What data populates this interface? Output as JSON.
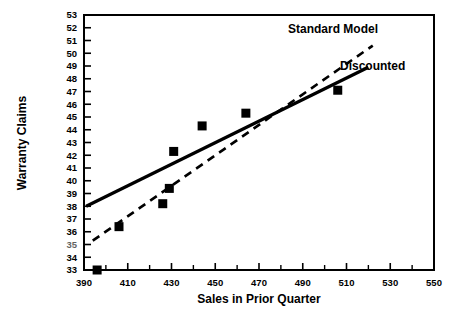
{
  "chart_data": {
    "type": "scatter",
    "title": "",
    "xlabel": "Sales in Prior Quarter",
    "ylabel": "Warranty Claims",
    "xlim": [
      390,
      550
    ],
    "ylim": [
      33,
      53
    ],
    "grid": false,
    "legend_position": "upper-right-inline",
    "x_ticks": [
      390,
      410,
      430,
      450,
      470,
      490,
      510,
      530,
      550
    ],
    "x_tick_labels": [
      "390",
      "410",
      "430",
      "450",
      "470",
      "490",
      "510",
      "530",
      "550"
    ],
    "x_minor_ticks": [
      400,
      420,
      440,
      460,
      480,
      500,
      520,
      540
    ],
    "y_ticks": [
      33,
      34,
      35,
      36,
      37,
      38,
      39,
      40,
      41,
      42,
      43,
      44,
      45,
      46,
      47,
      48,
      49,
      50,
      51,
      52,
      53
    ],
    "y_tick_labels": [
      "33",
      "34",
      "35",
      "36",
      "37",
      "38",
      "39",
      "40",
      "41",
      "42",
      "43",
      "44",
      "45",
      "46",
      "47",
      "48",
      "49",
      "50",
      "51",
      "52",
      "53"
    ],
    "y_tick_label_notes": "the 35 label is rendered smudged/degraded in the source image",
    "points": [
      {
        "x": 396,
        "y": 33.0
      },
      {
        "x": 406,
        "y": 36.4
      },
      {
        "x": 426,
        "y": 38.2
      },
      {
        "x": 429,
        "y": 39.4
      },
      {
        "x": 431,
        "y": 42.3
      },
      {
        "x": 444,
        "y": 44.3
      },
      {
        "x": 464,
        "y": 45.3
      },
      {
        "x": 506,
        "y": 47.1
      }
    ],
    "marker": {
      "shape": "square",
      "color": "#000000",
      "size": 9
    },
    "series": [
      {
        "name": "Standard Model",
        "style": "dashed",
        "color": "#000000",
        "endpoints": [
          {
            "x": 394,
            "y": 35.3
          },
          {
            "x": 522,
            "y": 50.6
          }
        ]
      },
      {
        "name": "Discounted",
        "style": "solid",
        "color": "#000000",
        "endpoints": [
          {
            "x": 391,
            "y": 38.0
          },
          {
            "x": 520,
            "y": 48.9
          }
        ]
      }
    ],
    "annotations": [
      {
        "text": "Standard Model",
        "x": 488,
        "y": 52.2
      },
      {
        "text": "Discounted",
        "x": 505,
        "y": 49.2
      }
    ]
  },
  "axis_titles": {
    "x": "Sales in Prior Quarter",
    "y": "Warranty Claims"
  },
  "legend_labels": {
    "standard_model": "Standard Model",
    "discounted": "Discounted"
  }
}
